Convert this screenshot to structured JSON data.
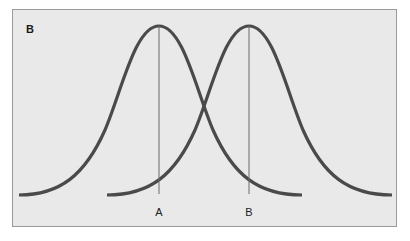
{
  "panel": {
    "label": "B",
    "background": "#e9e9e9",
    "border_color": "#9a9a9a"
  },
  "curves": [
    {
      "name": "distribution-a",
      "peak_x": 159,
      "peak_y": 26,
      "base_y": 195,
      "start_x": 19,
      "end_x": 302,
      "color": "#4a4a4a"
    },
    {
      "name": "distribution-b",
      "peak_x": 249,
      "peak_y": 26,
      "base_y": 195,
      "start_x": 107,
      "end_x": 392,
      "color": "#4a4a4a"
    }
  ],
  "markers": [
    {
      "label": "A",
      "x": 159
    },
    {
      "label": "B",
      "x": 249
    }
  ],
  "caption": {
    "text": "",
    "note": "clipped caption line, illegible"
  }
}
